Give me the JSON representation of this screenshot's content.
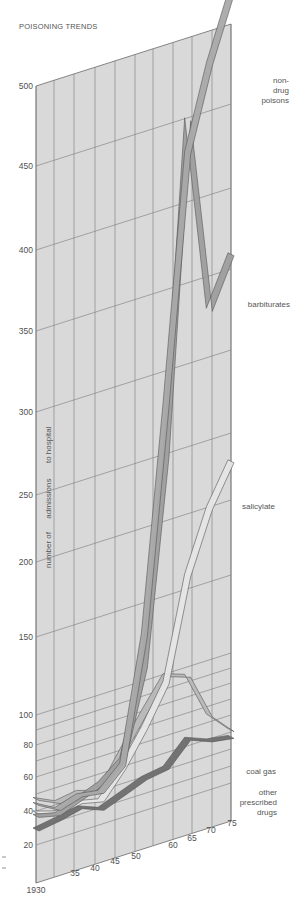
{
  "title": "POISONING TRENDS",
  "y_axis_title": [
    "number of",
    "admissions",
    "to hospital"
  ],
  "series_labels": {
    "non_drug_poisons": [
      "non-",
      "drug",
      "poisons"
    ],
    "barbiturates": "barbiturates",
    "salicylate": "salicylate",
    "coal_gas": "coal gas",
    "other_prescribed_drugs": [
      "other",
      "prescribed",
      "drugs"
    ]
  },
  "colors": {
    "panel": "#d9d9d9",
    "grid": "#7a7a7a",
    "non_drug_poisons": "#a9a9a9",
    "barbiturates": "#9e9e9e",
    "salicylate": "#e6e6e6",
    "coal_gas": "#b8b8b8",
    "other_prescribed_drugs": "#6e6e6e",
    "text": "#4f4f4f"
  },
  "chart_data": {
    "type": "line",
    "title": "POISONING TRENDS",
    "xlabel": "",
    "ylabel": "number of admissions to hospital",
    "x_tick_labels": [
      "1930",
      "35",
      "40",
      "45",
      "50",
      "60",
      "65",
      "70",
      "75"
    ],
    "y_tick_labels": [
      "20",
      "40",
      "60",
      "80",
      "100",
      "150",
      "200",
      "250",
      "300",
      "350",
      "400",
      "450",
      "500"
    ],
    "ylim": [
      0,
      500
    ],
    "y_scale_note": "non-linear: 0-100 compressed at bottom",
    "x": [
      1930,
      1935,
      1940,
      1945,
      1950,
      1955,
      1960,
      1965,
      1970,
      1975
    ],
    "series": [
      {
        "name": "non-drug poisons",
        "values": [
          45,
          38,
          42,
          40,
          52,
          130,
          280,
          430,
          480,
          520
        ]
      },
      {
        "name": "barbiturates",
        "values": [
          38,
          35,
          40,
          45,
          55,
          110,
          250,
          450,
          330,
          360
        ]
      },
      {
        "name": "salicylate",
        "values": [
          40,
          36,
          38,
          35,
          50,
          70,
          95,
          160,
          200,
          230
        ]
      },
      {
        "name": "coal gas",
        "values": [
          48,
          42,
          44,
          40,
          60,
          80,
          100,
          95,
          65,
          52
        ]
      },
      {
        "name": "other prescribed drugs",
        "values": [
          30,
          32,
          35,
          30,
          35,
          40,
          42,
          55,
          50,
          48
        ]
      }
    ],
    "grid": true,
    "legend_position": "right, inline labels"
  }
}
